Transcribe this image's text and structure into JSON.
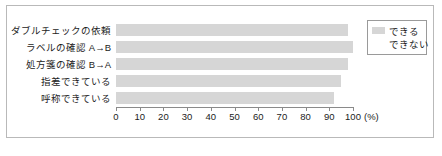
{
  "chart_data": {
    "type": "bar",
    "orientation": "horizontal",
    "title": "",
    "xlabel": "(%)",
    "ylabel": "",
    "xlim": [
      0,
      100
    ],
    "xticks": [
      0,
      10,
      20,
      30,
      40,
      50,
      60,
      70,
      80,
      90,
      100
    ],
    "grid": false,
    "legend_position": "top-right",
    "categories": [
      "ダブルチェックの依頼",
      "ラベルの確認 A→B",
      "処方箋の確認 B→A",
      "指差できている",
      "呼称できている"
    ],
    "series": [
      {
        "name": "できる",
        "color": "#d6d6d6",
        "values": [
          98,
          100,
          98,
          95,
          92
        ]
      },
      {
        "name": "できない",
        "color": "#ffffff",
        "values": [
          2,
          0,
          2,
          5,
          8
        ]
      }
    ]
  },
  "legend": {
    "items": [
      {
        "label": "できる",
        "color": "#d6d6d6"
      },
      {
        "label": "できない",
        "color": "#ffffff"
      }
    ]
  },
  "axis": {
    "unit": "(%)",
    "ticks": [
      "0",
      "10",
      "20",
      "30",
      "40",
      "50",
      "60",
      "70",
      "80",
      "90",
      "100"
    ]
  },
  "colors": {
    "bar": "#d6d6d6",
    "frame": "#b9b9b9",
    "axis": "#8a8a8a",
    "text": "#1c1c1c"
  }
}
